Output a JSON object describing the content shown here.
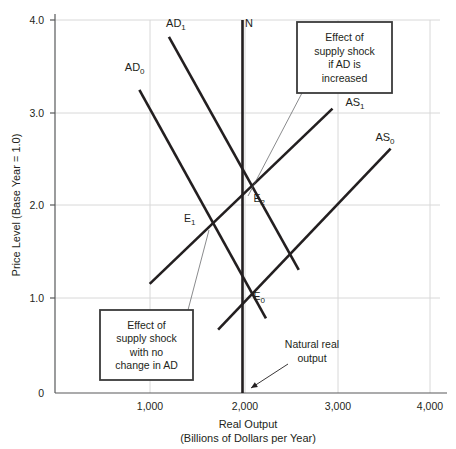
{
  "chart_data": {
    "type": "line",
    "title": "",
    "xlabel": "Real Output",
    "xlabel_sub": "(Billions of Dollars per Year)",
    "ylabel": "Price Level (Base Year = 1.0)",
    "xlim": [
      0,
      4000
    ],
    "ylim": [
      0,
      4.0
    ],
    "grid": true,
    "legend_position": "inline-labels",
    "xticks": [
      {
        "value": 1000,
        "label": "1,000"
      },
      {
        "value": 2000,
        "label": "2,000"
      },
      {
        "value": 3000,
        "label": "3,000"
      },
      {
        "value": 4000,
        "label": "4,000"
      }
    ],
    "yticks": [
      {
        "value": 0,
        "label": "0"
      },
      {
        "value": 1.0,
        "label": "1.0"
      },
      {
        "value": 2.0,
        "label": "2.0"
      },
      {
        "value": 3.0,
        "label": "3.0"
      },
      {
        "value": 4.0,
        "label": "4.0"
      }
    ],
    "series": [
      {
        "name": "AD0",
        "label_base": "AD",
        "label_sub": "0",
        "label_xy": [
          850,
          3.45
        ],
        "points": [
          [
            900,
            3.25
          ],
          [
            2250,
            0.8
          ]
        ]
      },
      {
        "name": "AD1",
        "label_base": "AD",
        "label_sub": "1",
        "label_xy": [
          1290,
          3.92
        ],
        "points": [
          [
            1215,
            3.82
          ],
          [
            2600,
            1.32
          ]
        ]
      },
      {
        "name": "AS0",
        "label_base": "AS",
        "label_sub": "0",
        "label_xy": [
          3520,
          2.7
        ],
        "points": [
          [
            1740,
            0.68
          ],
          [
            3580,
            2.62
          ]
        ]
      },
      {
        "name": "AS1",
        "label_base": "AS",
        "label_sub": "1",
        "label_xy": [
          3200,
          3.08
        ],
        "points": [
          [
            1010,
            1.17
          ],
          [
            2960,
            3.05
          ]
        ]
      },
      {
        "name": "N",
        "label_base": "N",
        "label_sub": "",
        "label_xy": [
          2070,
          3.92
        ],
        "points": [
          [
            2000,
            4.0
          ],
          [
            2000,
            0.0
          ]
        ]
      }
    ],
    "equilibria": [
      {
        "name": "E0",
        "base": "E",
        "sub": "0",
        "x": 2000,
        "y": 1.05,
        "label_dx": 11,
        "label_dy": 5
      },
      {
        "name": "E1",
        "base": "E",
        "sub": "1",
        "x": 1610,
        "y": 1.78,
        "label_dx": -22,
        "label_dy": -5
      },
      {
        "name": "E2",
        "base": "E",
        "sub": "2",
        "x": 2000,
        "y": 2.12,
        "label_dx": 11,
        "label_dy": 7
      }
    ],
    "annotations": [
      {
        "name": "callout-supply-shock-ad-increased",
        "lines": [
          "Effect of",
          "supply shock",
          "if AD is",
          "increased"
        ],
        "box_px": [
          297,
          22,
          95,
          71
        ],
        "leader_from_px": [
          302,
          93
        ],
        "leader_to_px": [
          248,
          196
        ]
      },
      {
        "name": "callout-supply-shock-no-change",
        "lines": [
          "Effect of",
          "supply shock",
          "with no",
          "change in AD"
        ],
        "box_px": [
          100,
          310,
          93,
          70
        ],
        "leader_from_px": [
          188,
          310
        ],
        "leader_to_px": [
          209,
          230
        ]
      },
      {
        "name": "natural-real-output",
        "lines": [
          "Natural real",
          "output"
        ],
        "text_center_px": [
          312,
          348
        ],
        "arrow_from_px": [
          288,
          364
        ],
        "arrow_to_px": [
          251,
          388
        ]
      }
    ]
  }
}
